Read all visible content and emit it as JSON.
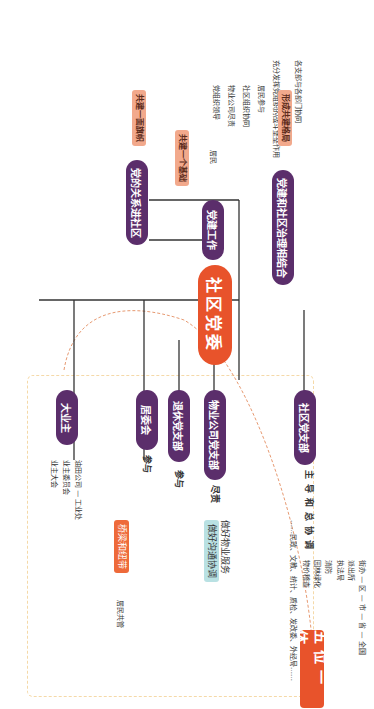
{
  "root": {
    "label": "社区党委"
  },
  "banner": {
    "label": "五位一体"
  },
  "upper_branches": [
    {
      "label": "社区党支部",
      "relation": "主导和总协调",
      "items": [
        "街办 — 区 — 市 — 省 — 全国",
        "派出所",
        "执法局",
        "消防",
        "园林绿化",
        "物价稽查",
        "……民政、文教、统计、质检、发改委、外经局……"
      ]
    },
    {
      "label": "物业公司党支部",
      "relation": "尽责",
      "items": [
        "做好物业服务",
        "做好沟通协调"
      ]
    },
    {
      "label": "退休党支部",
      "relation": "参与"
    },
    {
      "label": "居委会",
      "relation": "参与"
    },
    {
      "label": "大业主",
      "items": [
        "油田公司 — 工业处",
        "业主委员会",
        "业主大会"
      ]
    }
  ],
  "bridge": {
    "label": "桥梁和纽带",
    "target": "居民共管"
  },
  "lower_branches": [
    {
      "label": "党的关系进社区",
      "tag": "共建一面旗帜"
    },
    {
      "label": "党建工作",
      "tag": "共建一个基础",
      "sub": {
        "label": "居民",
        "items": [
          "党组织领导",
          "物业公司尽责",
          "社区组织协同",
          "居民参与"
        ]
      },
      "extra": "充分发挥党组织的战斗堡垒作用"
    },
    {
      "label": "党建和社区治理相结合",
      "tag": "形成共建格局",
      "extra": "各支部与各部门协同"
    }
  ],
  "colors": {
    "root": "#e8532b",
    "branch": "#5b2e6b",
    "tag_orange": "#ee6a3a",
    "tag_pink": "#f2a98c",
    "tag_teal": "#b9e1e3",
    "dashed": "#f5d9a8"
  }
}
